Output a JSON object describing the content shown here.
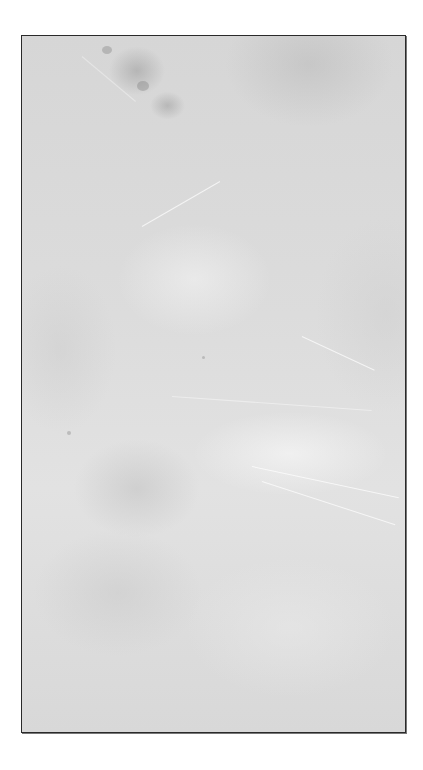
{
  "image": {
    "description": "Grayscale textured stone or concrete surface inside a thin dark rectangular border",
    "colors": {
      "background": "#ffffff",
      "surface": "#d9d9d9",
      "border": "#2a2a2a"
    }
  }
}
